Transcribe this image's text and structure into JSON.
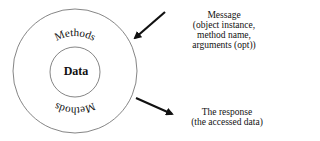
{
  "diagram": {
    "inner_label": "Data",
    "outer_label_top": "Methods",
    "outer_label_bottom": "Methods",
    "message": {
      "lines": [
        "Message",
        "(object instance,",
        "method name,",
        "arguments (opt))"
      ]
    },
    "response": {
      "lines": [
        "The response",
        "(the accessed data)"
      ]
    },
    "colors": {
      "stroke": "#555555",
      "arrow": "#111111",
      "text": "#111111"
    }
  }
}
